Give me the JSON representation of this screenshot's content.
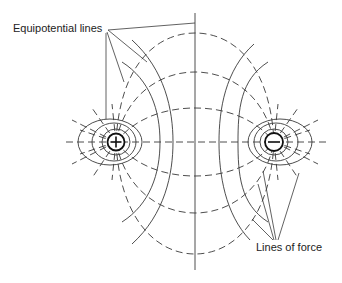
{
  "diagram": {
    "labels": {
      "equipotential": "Equipotential lines",
      "lines_of_force": "Lines of force"
    },
    "charges": [
      {
        "sign": "+",
        "name": "positive-charge",
        "cx": 116,
        "cy": 142
      },
      {
        "sign": "−",
        "name": "negative-charge",
        "cx": 274,
        "cy": 142
      }
    ],
    "colors": {
      "line": "#3a3a3a",
      "charge": "#111111",
      "background": "#ffffff",
      "text": "#222222"
    }
  }
}
